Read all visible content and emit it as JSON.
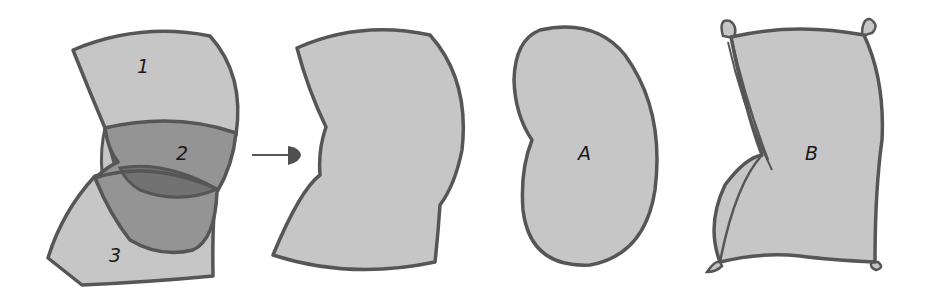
{
  "colors": {
    "fill": "#c6c6c6",
    "stroke": "#565656",
    "region2": "#949494",
    "overlap": "#727272",
    "region3_shade": "#a8a8a8",
    "background": "#ffffff"
  },
  "figure_1": {
    "description": "Three overlapping bands (1, 2, 3) combining into one folded shape",
    "labels": {
      "band1": "1",
      "band2": "2",
      "band3": "3"
    }
  },
  "arrow": {
    "direction": "right",
    "meaning": "combines into"
  },
  "figure_2": {
    "description": "Combined folded silhouette"
  },
  "figure_3": {
    "label": "A",
    "description": "Kidney/bean shaped form"
  },
  "figure_4": {
    "label": "B",
    "description": "Pillow-like cushion with corner tabs and a fold crease"
  }
}
